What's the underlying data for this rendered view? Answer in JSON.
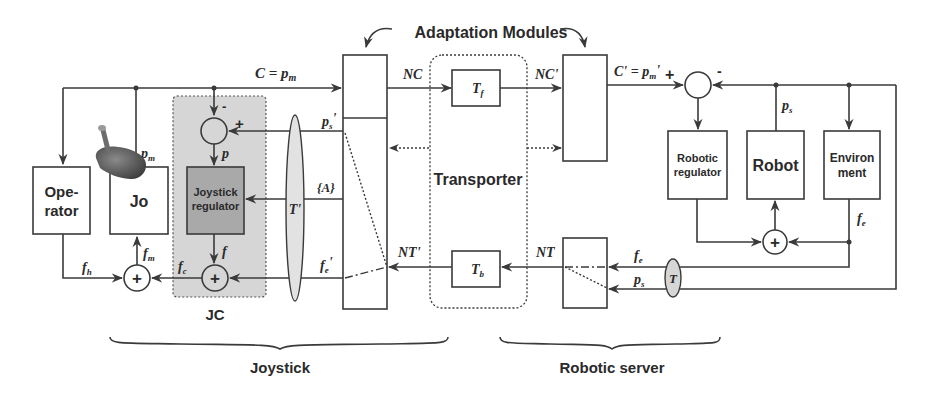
{
  "title": "Adaptation Modules",
  "blocks": {
    "operator": "Ope-\nrator",
    "operator_line1": "Ope-",
    "operator_line2": "rator",
    "jo": "Jo",
    "joystick_regulator_line1": "Joystick",
    "joystick_regulator_line2": "regulator",
    "jc": "JC",
    "transporter": "Transporter",
    "tf": "T",
    "tf_sub": "f",
    "tb": "T",
    "tb_sub": "b",
    "robotic_regulator_line1": "Robotic",
    "robotic_regulator_line2": "regulator",
    "robot": "Robot",
    "environment_line1": "Environ",
    "environment_line2": "ment",
    "t_prime": "T'",
    "t": "T"
  },
  "signals": {
    "c_eq_pm": "C = p",
    "c_eq_pm_sub": "m",
    "pm": "p",
    "pm_sub": "m",
    "p": "p",
    "ps_prime": "p",
    "ps_prime_sub": "s",
    "ps_prime_mark": "'",
    "a_set": "{A}",
    "f": "f",
    "fc": "f",
    "fc_sub": "c",
    "fh": "f",
    "fh_sub": "h",
    "fm": "f",
    "fm_sub": "m",
    "fe_prime": "f",
    "fe_prime_sub": "e",
    "fe_prime_mark": "'",
    "nc": "NC",
    "nc_prime": "NC'",
    "nt": "NT",
    "nt_prime": "NT'",
    "c_prime": "C' = p",
    "c_prime_sub": "m",
    "c_prime_mark": "'",
    "ps": "p",
    "ps_sub": "s",
    "fe": "f",
    "fe_sub": "e"
  },
  "operators": {
    "plus": "+",
    "minus": "-"
  },
  "groups": {
    "joystick": "Joystick",
    "robotic_server": "Robotic server"
  }
}
